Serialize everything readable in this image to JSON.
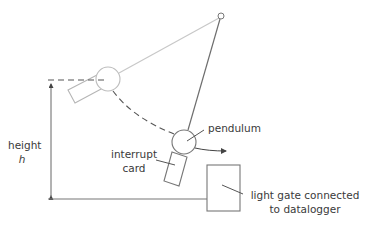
{
  "labels": {
    "height": "height",
    "height_symbol": "h",
    "interrupt_line1": "interrupt",
    "interrupt_line2": "card",
    "pendulum": "pendulum",
    "lightgate_line1": "light gate connected",
    "lightgate_line2": "to datalogger"
  },
  "colors": {
    "string_light": "#c8c8c8",
    "string_dark": "#6e6e6e",
    "outline": "#8a8a8a",
    "dash": "#555555",
    "text": "#3a3a3a"
  }
}
